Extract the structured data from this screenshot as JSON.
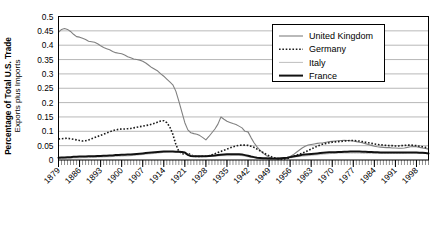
{
  "chart_data": {
    "type": "line",
    "title": "",
    "xlabel": "",
    "ylabel": "Percentage of Total U.S. Trade",
    "ylabel_sub": "Exports plus Imports",
    "grid": true,
    "legend_position": "top-right",
    "xlim": [
      1879,
      2002
    ],
    "ylim": [
      0,
      0.5
    ],
    "ytick_labels": [
      "0",
      "0.05",
      "0.1",
      "0.15",
      "0.2",
      "0.25",
      "0.3",
      "0.35",
      "0.4",
      "0.45",
      "0.5"
    ],
    "ytick_values": [
      0,
      0.05,
      0.1,
      0.15,
      0.2,
      0.25,
      0.3,
      0.35,
      0.4,
      0.45,
      0.5
    ],
    "xtick_labels": [
      "1879",
      "1886",
      "1893",
      "1900",
      "1907",
      "1914",
      "1921",
      "1928",
      "1935",
      "1942",
      "1949",
      "1956",
      "1963",
      "1970",
      "1977",
      "1984",
      "1991",
      "1998"
    ],
    "xtick_values": [
      1879,
      1886,
      1893,
      1900,
      1907,
      1914,
      1921,
      1928,
      1935,
      1942,
      1949,
      1956,
      1963,
      1970,
      1977,
      1984,
      1991,
      1998
    ],
    "minor_tick_interval": 1,
    "series": [
      {
        "name": "United Kingdom",
        "color": "#808080",
        "style": "solid",
        "width": 1.1,
        "x": [
          1879,
          1880,
          1881,
          1882,
          1883,
          1884,
          1885,
          1886,
          1887,
          1888,
          1889,
          1890,
          1891,
          1892,
          1893,
          1894,
          1895,
          1896,
          1897,
          1898,
          1899,
          1900,
          1901,
          1902,
          1903,
          1904,
          1905,
          1906,
          1907,
          1908,
          1909,
          1910,
          1911,
          1912,
          1913,
          1914,
          1915,
          1916,
          1917,
          1918,
          1919,
          1920,
          1921,
          1922,
          1923,
          1924,
          1925,
          1926,
          1927,
          1928,
          1929,
          1930,
          1931,
          1932,
          1933,
          1934,
          1935,
          1936,
          1937,
          1938,
          1939,
          1940,
          1941,
          1942,
          1943,
          1944,
          1945,
          1946,
          1947,
          1948,
          1949,
          1950,
          1951,
          1952,
          1953,
          1954,
          1955,
          1956,
          1957,
          1958,
          1959,
          1960,
          1961,
          1962,
          1963,
          1964,
          1965,
          1966,
          1967,
          1968,
          1969,
          1970,
          1971,
          1972,
          1973,
          1974,
          1975,
          1976,
          1977,
          1978,
          1979,
          1980,
          1981,
          1982,
          1983,
          1984,
          1985,
          1986,
          1987,
          1988,
          1989,
          1990,
          1991,
          1992,
          1993,
          1994,
          1995,
          1996,
          1997,
          1998,
          1999,
          2000,
          2001,
          2002
        ],
        "values": [
          0.445,
          0.455,
          0.458,
          0.455,
          0.448,
          0.438,
          0.43,
          0.428,
          0.424,
          0.42,
          0.414,
          0.412,
          0.41,
          0.405,
          0.398,
          0.392,
          0.388,
          0.384,
          0.378,
          0.374,
          0.372,
          0.37,
          0.366,
          0.36,
          0.356,
          0.352,
          0.35,
          0.348,
          0.344,
          0.338,
          0.33,
          0.322,
          0.316,
          0.31,
          0.3,
          0.292,
          0.282,
          0.272,
          0.262,
          0.24,
          0.205,
          0.168,
          0.13,
          0.105,
          0.095,
          0.092,
          0.09,
          0.085,
          0.078,
          0.07,
          0.082,
          0.095,
          0.108,
          0.125,
          0.15,
          0.142,
          0.135,
          0.131,
          0.127,
          0.124,
          0.118,
          0.112,
          0.1,
          0.098,
          0.078,
          0.06,
          0.046,
          0.034,
          0.024,
          0.016,
          0.01,
          0.006,
          0.005,
          0.004,
          0.004,
          0.005,
          0.008,
          0.012,
          0.018,
          0.026,
          0.034,
          0.042,
          0.048,
          0.052,
          0.054,
          0.056,
          0.058,
          0.059,
          0.06,
          0.062,
          0.064,
          0.065,
          0.066,
          0.067,
          0.068,
          0.069,
          0.068,
          0.067,
          0.066,
          0.064,
          0.062,
          0.06,
          0.057,
          0.054,
          0.051,
          0.048,
          0.046,
          0.045,
          0.044,
          0.043,
          0.043,
          0.042,
          0.042,
          0.041,
          0.041,
          0.042,
          0.044,
          0.046,
          0.047,
          0.046,
          0.044,
          0.042,
          0.04,
          0.038
        ]
      },
      {
        "name": "Germany",
        "color": "#1a1a1a",
        "style": "dotted",
        "width": 1.6,
        "x": [
          1879,
          1880,
          1881,
          1882,
          1883,
          1884,
          1885,
          1886,
          1887,
          1888,
          1889,
          1890,
          1891,
          1892,
          1893,
          1894,
          1895,
          1896,
          1897,
          1898,
          1899,
          1900,
          1901,
          1902,
          1903,
          1904,
          1905,
          1906,
          1907,
          1908,
          1909,
          1910,
          1911,
          1912,
          1913,
          1914,
          1915,
          1916,
          1917,
          1918,
          1919,
          1920,
          1921,
          1922,
          1923,
          1924,
          1925,
          1926,
          1927,
          1928,
          1929,
          1930,
          1931,
          1932,
          1933,
          1934,
          1935,
          1936,
          1937,
          1938,
          1939,
          1940,
          1941,
          1942,
          1943,
          1944,
          1945,
          1946,
          1947,
          1948,
          1949,
          1950,
          1951,
          1952,
          1953,
          1954,
          1955,
          1956,
          1957,
          1958,
          1959,
          1960,
          1961,
          1962,
          1963,
          1964,
          1965,
          1966,
          1967,
          1968,
          1969,
          1970,
          1971,
          1972,
          1973,
          1974,
          1975,
          1976,
          1977,
          1978,
          1979,
          1980,
          1981,
          1982,
          1983,
          1984,
          1985,
          1986,
          1987,
          1988,
          1989,
          1990,
          1991,
          1992,
          1993,
          1994,
          1995,
          1996,
          1997,
          1998,
          1999,
          2000,
          2001,
          2002
        ],
        "values": [
          0.073,
          0.074,
          0.075,
          0.076,
          0.074,
          0.072,
          0.07,
          0.068,
          0.066,
          0.067,
          0.07,
          0.074,
          0.078,
          0.082,
          0.086,
          0.09,
          0.094,
          0.098,
          0.102,
          0.105,
          0.107,
          0.108,
          0.108,
          0.109,
          0.11,
          0.112,
          0.114,
          0.116,
          0.118,
          0.12,
          0.122,
          0.125,
          0.128,
          0.132,
          0.136,
          0.137,
          0.13,
          0.115,
          0.09,
          0.055,
          0.03,
          0.022,
          0.02,
          0.024,
          0.018,
          0.014,
          0.012,
          0.012,
          0.013,
          0.013,
          0.015,
          0.018,
          0.022,
          0.026,
          0.03,
          0.034,
          0.038,
          0.042,
          0.046,
          0.049,
          0.051,
          0.052,
          0.052,
          0.051,
          0.048,
          0.044,
          0.038,
          0.032,
          0.026,
          0.02,
          0.015,
          0.01,
          0.007,
          0.005,
          0.004,
          0.004,
          0.005,
          0.008,
          0.012,
          0.016,
          0.02,
          0.024,
          0.028,
          0.033,
          0.038,
          0.043,
          0.048,
          0.052,
          0.056,
          0.058,
          0.06,
          0.062,
          0.063,
          0.064,
          0.065,
          0.066,
          0.067,
          0.068,
          0.068,
          0.067,
          0.066,
          0.064,
          0.062,
          0.06,
          0.058,
          0.056,
          0.054,
          0.053,
          0.052,
          0.051,
          0.05,
          0.05,
          0.049,
          0.049,
          0.05,
          0.051,
          0.052,
          0.052,
          0.051,
          0.05,
          0.048,
          0.046,
          0.044,
          0.042
        ]
      },
      {
        "name": "Italy",
        "color": "#bfbfbf",
        "style": "solid",
        "width": 1.0,
        "x": [
          1879,
          1880,
          1881,
          1882,
          1883,
          1884,
          1885,
          1886,
          1887,
          1888,
          1889,
          1890,
          1891,
          1892,
          1893,
          1894,
          1895,
          1896,
          1897,
          1898,
          1899,
          1900,
          1901,
          1902,
          1903,
          1904,
          1905,
          1906,
          1907,
          1908,
          1909,
          1910,
          1911,
          1912,
          1913,
          1914,
          1915,
          1916,
          1917,
          1918,
          1919,
          1920,
          1921,
          1922,
          1923,
          1924,
          1925,
          1926,
          1927,
          1928,
          1929,
          1930,
          1931,
          1932,
          1933,
          1934,
          1935,
          1936,
          1937,
          1938,
          1939,
          1940,
          1941,
          1942,
          1943,
          1944,
          1945,
          1946,
          1947,
          1948,
          1949,
          1950,
          1951,
          1952,
          1953,
          1954,
          1955,
          1956,
          1957,
          1958,
          1959,
          1960,
          1961,
          1962,
          1963,
          1964,
          1965,
          1966,
          1967,
          1968,
          1969,
          1970,
          1971,
          1972,
          1973,
          1974,
          1975,
          1976,
          1977,
          1978,
          1979,
          1980,
          1981,
          1982,
          1983,
          1984,
          1985,
          1986,
          1987,
          1988,
          1989,
          1990,
          1991,
          1992,
          1993,
          1994,
          1995,
          1996,
          1997,
          1998,
          1999,
          2000,
          2001,
          2002
        ],
        "values": [
          0.005,
          0.005,
          0.006,
          0.006,
          0.006,
          0.007,
          0.007,
          0.007,
          0.008,
          0.008,
          0.008,
          0.009,
          0.009,
          0.009,
          0.01,
          0.01,
          0.011,
          0.011,
          0.012,
          0.012,
          0.013,
          0.013,
          0.014,
          0.014,
          0.015,
          0.016,
          0.017,
          0.018,
          0.019,
          0.02,
          0.021,
          0.022,
          0.023,
          0.024,
          0.025,
          0.027,
          0.028,
          0.029,
          0.029,
          0.028,
          0.027,
          0.026,
          0.024,
          0.02,
          0.016,
          0.014,
          0.013,
          0.013,
          0.013,
          0.012,
          0.013,
          0.014,
          0.014,
          0.014,
          0.015,
          0.015,
          0.015,
          0.015,
          0.016,
          0.016,
          0.016,
          0.015,
          0.013,
          0.011,
          0.009,
          0.008,
          0.007,
          0.006,
          0.005,
          0.005,
          0.005,
          0.005,
          0.005,
          0.005,
          0.006,
          0.007,
          0.008,
          0.009,
          0.01,
          0.011,
          0.012,
          0.013,
          0.014,
          0.015,
          0.016,
          0.017,
          0.018,
          0.019,
          0.02,
          0.021,
          0.022,
          0.023,
          0.023,
          0.024,
          0.024,
          0.024,
          0.024,
          0.024,
          0.024,
          0.024,
          0.024,
          0.023,
          0.023,
          0.023,
          0.023,
          0.023,
          0.023,
          0.023,
          0.023,
          0.023,
          0.023,
          0.023,
          0.023,
          0.023,
          0.023,
          0.023,
          0.024,
          0.024,
          0.024,
          0.024,
          0.024,
          0.024,
          0.023,
          0.023
        ]
      },
      {
        "name": "France",
        "color": "#111111",
        "style": "solid",
        "width": 2.0,
        "x": [
          1879,
          1880,
          1881,
          1882,
          1883,
          1884,
          1885,
          1886,
          1887,
          1888,
          1889,
          1890,
          1891,
          1892,
          1893,
          1894,
          1895,
          1896,
          1897,
          1898,
          1899,
          1900,
          1901,
          1902,
          1903,
          1904,
          1905,
          1906,
          1907,
          1908,
          1909,
          1910,
          1911,
          1912,
          1913,
          1914,
          1915,
          1916,
          1917,
          1918,
          1919,
          1920,
          1921,
          1922,
          1923,
          1924,
          1925,
          1926,
          1927,
          1928,
          1929,
          1930,
          1931,
          1932,
          1933,
          1934,
          1935,
          1936,
          1937,
          1938,
          1939,
          1940,
          1941,
          1942,
          1943,
          1944,
          1945,
          1946,
          1947,
          1948,
          1949,
          1950,
          1951,
          1952,
          1953,
          1954,
          1955,
          1956,
          1957,
          1958,
          1959,
          1960,
          1961,
          1962,
          1963,
          1964,
          1965,
          1966,
          1967,
          1968,
          1969,
          1970,
          1971,
          1972,
          1973,
          1974,
          1975,
          1976,
          1977,
          1978,
          1979,
          1980,
          1981,
          1982,
          1983,
          1984,
          1985,
          1986,
          1987,
          1988,
          1989,
          1990,
          1991,
          1992,
          1993,
          1994,
          1995,
          1996,
          1997,
          1998,
          1999,
          2000,
          2001,
          2002
        ],
        "values": [
          0.008,
          0.009,
          0.009,
          0.01,
          0.01,
          0.011,
          0.011,
          0.012,
          0.012,
          0.012,
          0.013,
          0.013,
          0.013,
          0.014,
          0.014,
          0.015,
          0.015,
          0.016,
          0.016,
          0.017,
          0.017,
          0.018,
          0.018,
          0.019,
          0.019,
          0.02,
          0.021,
          0.022,
          0.023,
          0.024,
          0.025,
          0.026,
          0.027,
          0.028,
          0.029,
          0.03,
          0.03,
          0.03,
          0.03,
          0.029,
          0.029,
          0.028,
          0.026,
          0.018,
          0.014,
          0.013,
          0.013,
          0.013,
          0.013,
          0.013,
          0.014,
          0.015,
          0.016,
          0.017,
          0.018,
          0.019,
          0.02,
          0.02,
          0.02,
          0.02,
          0.02,
          0.019,
          0.017,
          0.015,
          0.012,
          0.01,
          0.008,
          0.007,
          0.006,
          0.006,
          0.005,
          0.005,
          0.005,
          0.005,
          0.006,
          0.007,
          0.008,
          0.01,
          0.012,
          0.014,
          0.016,
          0.018,
          0.019,
          0.02,
          0.021,
          0.022,
          0.023,
          0.024,
          0.025,
          0.026,
          0.027,
          0.027,
          0.027,
          0.028,
          0.028,
          0.029,
          0.029,
          0.03,
          0.03,
          0.03,
          0.03,
          0.029,
          0.029,
          0.028,
          0.028,
          0.027,
          0.027,
          0.026,
          0.026,
          0.026,
          0.026,
          0.026,
          0.026,
          0.026,
          0.026,
          0.026,
          0.026,
          0.026,
          0.026,
          0.026,
          0.025,
          0.025,
          0.024,
          0.023
        ]
      }
    ]
  },
  "legend": {
    "items": [
      {
        "label": "United Kingdom"
      },
      {
        "label": "Germany"
      },
      {
        "label": "Italy"
      },
      {
        "label": "France"
      }
    ]
  }
}
